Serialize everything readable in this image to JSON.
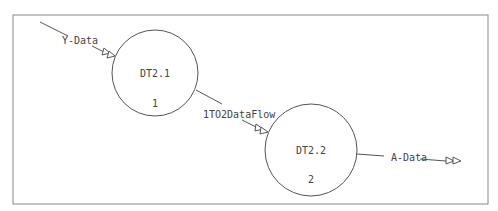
{
  "diagram": {
    "type": "data-flow-diagram",
    "frame": {
      "x": 13,
      "y": 15,
      "width": 475,
      "height": 189,
      "stroke": "#888888"
    },
    "processes": [
      {
        "id": "DT2.1",
        "name": "DT2.1",
        "number": "1",
        "cx": 155,
        "cy": 73,
        "r": 43
      },
      {
        "id": "DT2.2",
        "name": "DT2.2",
        "number": "2",
        "cx": 311,
        "cy": 150,
        "r": 46
      }
    ],
    "flows": [
      {
        "label": "Y-Data",
        "from": "external",
        "to": "DT2.1"
      },
      {
        "label": "1TO2DataFlow",
        "from": "DT2.1",
        "to": "DT2.2"
      },
      {
        "label": "A-Data",
        "from": "DT2.2",
        "to": "external"
      }
    ],
    "colors": {
      "line": "#555555",
      "text": "#444444",
      "frame": "#888888"
    }
  }
}
